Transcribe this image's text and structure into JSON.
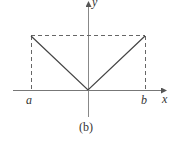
{
  "figure": {
    "caption": "(b)",
    "axes": {
      "x_label": "x",
      "y_label": "y"
    },
    "ticks": {
      "left": "a",
      "right": "b"
    },
    "colors": {
      "line": "#444444",
      "axis": "#666666",
      "dashed": "#555555"
    }
  }
}
